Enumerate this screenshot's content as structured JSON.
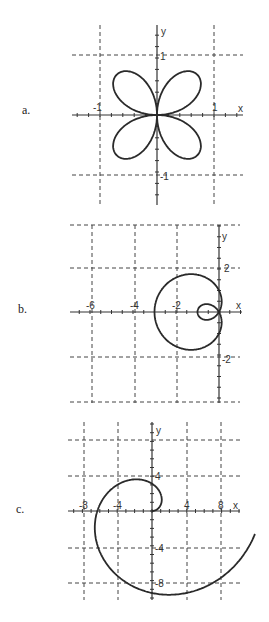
{
  "graphs": [
    {
      "id": "a",
      "label": "a.",
      "curve": "four-leaf rose",
      "origin_px": [
        157,
        115
      ],
      "scale_px": 57,
      "grid_x": [
        -1,
        1
      ],
      "grid_y": [
        1,
        -1
      ],
      "tick_labels": {
        "x_neg": "-1",
        "x_pos": "1",
        "y_pos": "1",
        "y_neg": "-1"
      },
      "axis_labels": {
        "x": "x",
        "y": "y"
      }
    },
    {
      "id": "b",
      "label": "b.",
      "curve": "limaçon with inner loop",
      "origin_px": [
        219,
        312
      ],
      "scale_px": 21.5,
      "grid_x": [
        -6,
        -4,
        -2
      ],
      "grid_y": [
        4,
        2,
        -2,
        -4
      ],
      "tick_labels": {
        "x1": "-6",
        "x2": "-4",
        "x3": "-2",
        "y_pos": "2",
        "y_neg": "-2"
      },
      "axis_labels": {
        "x": "x",
        "y": "y"
      }
    },
    {
      "id": "c",
      "label": "c.",
      "curve": "spiral",
      "origin_px": [
        152,
        511
      ],
      "scale_px": 8.7,
      "grid_x": [
        -8,
        -4,
        4,
        8
      ],
      "grid_y": [
        8,
        4,
        -4,
        -8
      ],
      "tick_labels": {
        "x1": "-8",
        "x2": "-4",
        "x3": "4",
        "x4": "8",
        "y_pos": "4",
        "y_neg1": "-4",
        "y_neg2": "-8"
      },
      "axis_labels": {
        "x": "x",
        "y": "y"
      }
    }
  ]
}
